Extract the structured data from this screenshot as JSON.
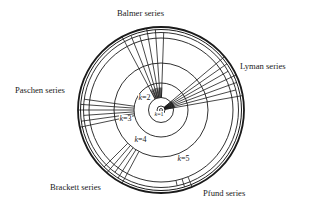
{
  "diagram": {
    "center": [
      161,
      110
    ],
    "colors": {
      "line": "#1a1a1a",
      "background": "#ffffff"
    },
    "orbits": [
      {
        "k": 1,
        "label": "k=1",
        "radius": 4
      },
      {
        "k": 2,
        "label": "k=2",
        "radius": 12.5
      },
      {
        "k": 3,
        "label": "k=3",
        "radius": 27
      },
      {
        "k": 4,
        "label": "k=4",
        "radius": 47
      },
      {
        "k": 5,
        "label": "k=5",
        "radius": 72
      }
    ],
    "outer_rings": [
      77.5,
      80.5,
      83
    ],
    "series": [
      {
        "name": "Lyman series",
        "lower_k": 1,
        "angle_from": -40,
        "angle_to": -10,
        "lines": 7
      },
      {
        "name": "Balmer series",
        "lower_k": 2,
        "angle_from": -118,
        "angle_to": -88,
        "lines": 6
      },
      {
        "name": "Paschen series",
        "lower_k": 3,
        "angle_from": 168,
        "angle_to": 188,
        "lines": 6
      },
      {
        "name": "Brackett series",
        "lower_k": 4,
        "angle_from": 118,
        "angle_to": 135,
        "lines": 5
      },
      {
        "name": "Pfund series",
        "lower_k": 5,
        "angle_from": 68,
        "angle_to": 78,
        "lines": 3
      }
    ],
    "labels": {
      "balmer": "Balmer series",
      "lyman": "Lyman series",
      "paschen": "Paschen series",
      "brackett": "Brackett series",
      "pfund": "Pfund series"
    },
    "k_labels": {
      "k1": "=1",
      "k2": "=2",
      "k3": "=3",
      "k4": "=4",
      "k5": "=5",
      "k_var": "k"
    }
  }
}
